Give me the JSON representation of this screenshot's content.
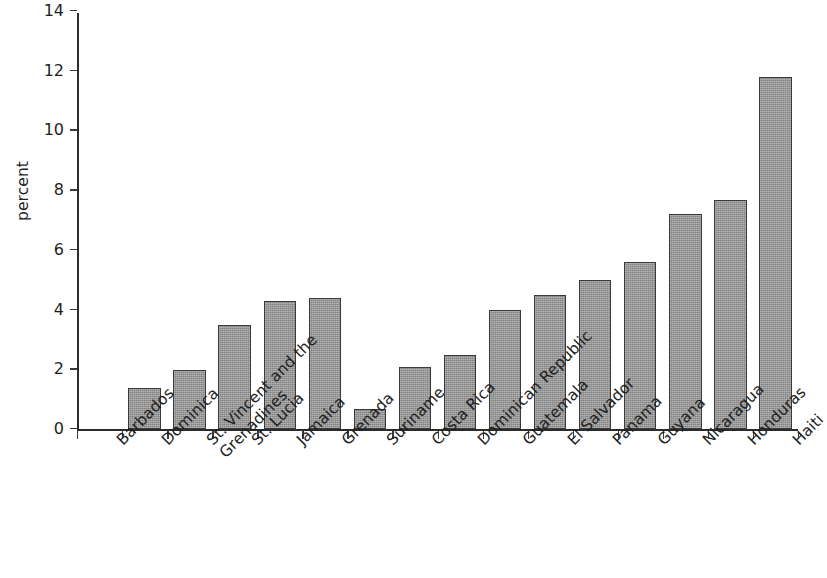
{
  "chart_data": {
    "type": "bar",
    "title": "",
    "subtitle": "",
    "xlabel": "",
    "ylabel": "percent",
    "ylim": [
      0,
      14
    ],
    "yticks": [
      0,
      2,
      4,
      6,
      8,
      10,
      12,
      14
    ],
    "ytick_labels": [
      "0",
      "2",
      "4",
      "6",
      "8",
      "10",
      "12",
      "14"
    ],
    "grid": false,
    "legend": null,
    "bar_color": "#9c9c9c",
    "bar_edge_color": "#3a3a3a",
    "axis_color": "#2b2b2b",
    "categories": [
      "Barbados",
      "Dominica",
      "St. Vincent and the Grenadines",
      "St. Lucia",
      "Jamaica",
      "Grenada",
      "Suriname",
      "Costa Rica",
      "Dominican Republic",
      "Guatemala",
      "El Salvador",
      "Panama",
      "Guyana",
      "Nicaragua",
      "Honduras",
      "Haiti"
    ],
    "category_lines": [
      [
        "Barbados"
      ],
      [
        "Dominica"
      ],
      [
        "St. Vincent and the",
        "Grenadines"
      ],
      [
        "St. Lucia"
      ],
      [
        "Jamaica"
      ],
      [
        "Grenada"
      ],
      [
        "Suriname"
      ],
      [
        "Costa Rica"
      ],
      [
        "Dominican Republic"
      ],
      [
        "Guatemala"
      ],
      [
        "El Salvador"
      ],
      [
        "Panama"
      ],
      [
        "Guyana"
      ],
      [
        "Nicaragua"
      ],
      [
        "Honduras"
      ],
      [
        "Haiti"
      ]
    ],
    "values": [
      0,
      1.4,
      2.0,
      3.5,
      4.3,
      4.4,
      0.7,
      2.1,
      2.5,
      4.0,
      4.5,
      5.0,
      5.6,
      7.2,
      7.7,
      11.8
    ]
  }
}
